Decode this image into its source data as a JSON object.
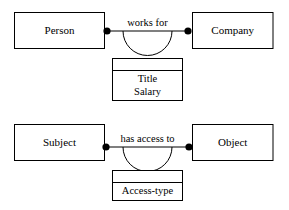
{
  "diagram": {
    "colors": {
      "stroke": "#000000",
      "fill": "#ffffff",
      "text": "#000000"
    },
    "relationships": [
      {
        "id": "works-for",
        "left_entity": "Person",
        "right_entity": "Company",
        "relationship_label": "works for",
        "attribute_box": {
          "header": "",
          "attributes": [
            "Title",
            "Salary"
          ]
        }
      },
      {
        "id": "has-access-to",
        "left_entity": "Subject",
        "right_entity": "Object",
        "relationship_label": "has access to",
        "attribute_box": {
          "header": "",
          "attributes": [
            "Access-type"
          ]
        }
      }
    ]
  }
}
